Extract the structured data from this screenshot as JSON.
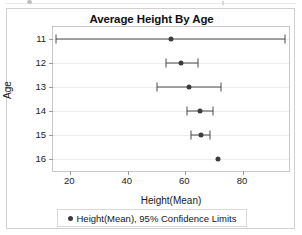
{
  "chart_data": {
    "type": "scatter",
    "title": "Average Height By Age",
    "xlabel": "Height(Mean)",
    "ylabel": "Age",
    "xlim": [
      14,
      96
    ],
    "xticks": [
      20,
      40,
      60,
      80
    ],
    "xtick_labels": [
      "20",
      "40",
      "60",
      "80"
    ],
    "categories": [
      "11",
      "12",
      "13",
      "14",
      "15",
      "16"
    ],
    "ytick_labels": [
      "11",
      "12",
      "13",
      "14",
      "15",
      "16"
    ],
    "grid": true,
    "grid_axis": "y",
    "legend_position": "bottom",
    "legend_entries": [
      "Height(Mean), 95% Confidence Limits"
    ],
    "marker_color": "#3d3d3d",
    "errorbar_color": "#4a4a4a",
    "series": [
      {
        "name": "Height(Mean), 95% Confidence Limits",
        "points": [
          {
            "age": "11",
            "mean": 55.0,
            "lower": 15.2,
            "upper": 94.5
          },
          {
            "age": "12",
            "mean": 58.6,
            "lower": 53.2,
            "upper": 64.4
          },
          {
            "age": "13",
            "mean": 61.2,
            "lower": 50.0,
            "upper": 72.5
          },
          {
            "age": "14",
            "mean": 65.0,
            "lower": 60.5,
            "upper": 69.5
          },
          {
            "age": "15",
            "mean": 65.5,
            "lower": 62.0,
            "upper": 68.5
          },
          {
            "age": "16",
            "mean": 71.5,
            "lower": null,
            "upper": null
          }
        ]
      }
    ]
  },
  "legend": {
    "label": "Height(Mean), 95% Confidence Limits"
  },
  "colors": {
    "marker": "#3d3d3d",
    "errorbar": "#4a4a4a",
    "grid": "#ededed",
    "frame": "#c8c8c8",
    "card_border": "#d0d0d0",
    "text": "#1a1a1a"
  }
}
